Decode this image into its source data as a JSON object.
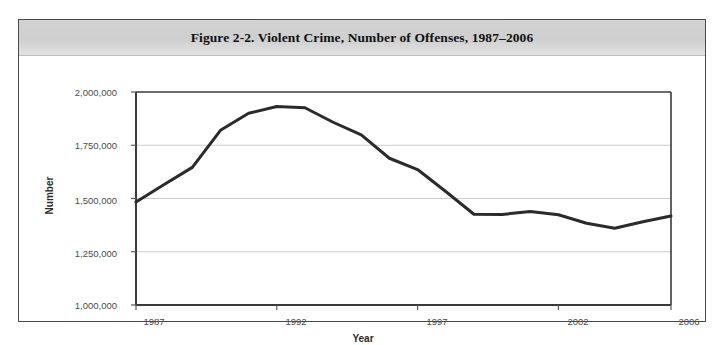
{
  "figure": {
    "title": "Figure 2-2. Violent Crime, Number of Offenses, 1987–2006",
    "border_color": "#4a4a4a",
    "title_bar_color": "#d0d0d0"
  },
  "chart_data": {
    "type": "line",
    "title": "Figure 2-2. Violent Crime, Number of Offenses, 1987–2006",
    "xlabel": "Year",
    "ylabel": "Number",
    "x": [
      1987,
      1988,
      1989,
      1990,
      1991,
      1992,
      1993,
      1994,
      1995,
      1996,
      1997,
      1998,
      1999,
      2000,
      2001,
      2002,
      2003,
      2004,
      2005,
      2006
    ],
    "values": [
      1484000,
      1566000,
      1646000,
      1820000,
      1900000,
      1932000,
      1926000,
      1858000,
      1799000,
      1689000,
      1636000,
      1533000,
      1426000,
      1425000,
      1439000,
      1424000,
      1384000,
      1360000,
      1391000,
      1418000
    ],
    "series": [
      {
        "name": "Violent Crime Offenses",
        "color": "#2b2b2b",
        "values": [
          1484000,
          1566000,
          1646000,
          1820000,
          1900000,
          1932000,
          1926000,
          1858000,
          1799000,
          1689000,
          1636000,
          1533000,
          1426000,
          1425000,
          1439000,
          1424000,
          1384000,
          1360000,
          1391000,
          1418000
        ]
      }
    ],
    "xlim": [
      1987,
      2006
    ],
    "ylim": [
      1000000,
      2000000
    ],
    "ytick_labels": [
      "2,000,000",
      "1,750,000",
      "1,500,000",
      "1,250,000",
      "1,000,000"
    ],
    "ytick_values": [
      2000000,
      1750000,
      1500000,
      1250000,
      1000000
    ],
    "xtick_labels": [
      "1987",
      "1992",
      "1997",
      "2002",
      "2006"
    ],
    "xtick_values": [
      1987,
      1992,
      1997,
      2002,
      2006
    ],
    "grid": true,
    "grid_color": "#cccccc",
    "legend": null,
    "line_color": "#2b2b2b",
    "line_width": 3
  }
}
